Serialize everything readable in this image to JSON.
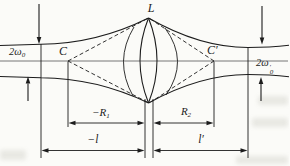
{
  "figure": {
    "type": "optics-gaussian-beam-lens-diagram",
    "colors": {
      "line": "#1c1c1c",
      "axis": "#777777",
      "background": "#fbfbf8"
    },
    "labels": {
      "lens": "L",
      "center_left": "C",
      "center_right": "C′",
      "waist_left_main": "2ω",
      "waist_left_sub": "0",
      "waist_right_main": "2ω",
      "waist_right_sub": "0",
      "waist_right_prime": "′",
      "radius_left_main": "−R",
      "radius_left_sub": "1",
      "radius_right_main": "R",
      "radius_right_sub": "2",
      "distance_left": "−l",
      "distance_right": "l′"
    }
  }
}
